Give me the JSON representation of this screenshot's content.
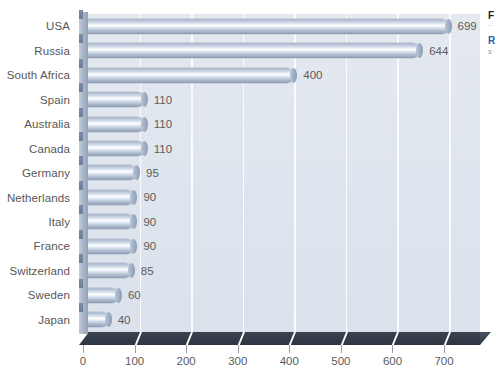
{
  "chart_data": {
    "type": "bar",
    "orientation": "horizontal",
    "title": "",
    "xlabel": "",
    "ylabel": "",
    "xlim": [
      0,
      760
    ],
    "xticks": [
      0,
      100,
      200,
      300,
      400,
      500,
      600,
      700
    ],
    "grid": "vertical-white-gridlines",
    "legend": "none",
    "categories": [
      "USA",
      "Russia",
      "South Africa",
      "Spain",
      "Australia",
      "Canada",
      "Germany",
      "Netherlands",
      "Italy",
      "France",
      "Switzerland",
      "Sweden",
      "Japan"
    ],
    "values": [
      699,
      644,
      400,
      110,
      110,
      110,
      95,
      90,
      90,
      90,
      85,
      60,
      40
    ],
    "value_labels": [
      "699",
      "644",
      "400",
      "110",
      "110",
      "110",
      "95",
      "90",
      "90",
      "90",
      "85",
      "60",
      "40"
    ],
    "colors": {
      "bar_light": "#ffffff",
      "bar_mid": "#bcc8da",
      "bar_dark": "#8d9cb4",
      "plot_background": "#dfe5ee",
      "gridline": "#fbfcfe",
      "floor": "#343b48",
      "text": "#5c5c5c",
      "page_background": "#ffffff"
    }
  },
  "side_caption": {
    "title_fragment": "F",
    "sub_fragment": "··",
    "heading_fragment": "R",
    "sub2_fragment": "s·"
  }
}
